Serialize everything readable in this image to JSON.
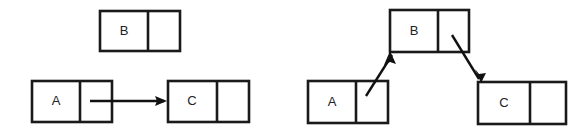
{
  "figure": {
    "background_color": "#ffffff",
    "stroke_color": "#1a1a1a",
    "arrow_color": "#111111",
    "label_color": "#222222",
    "width": 587,
    "height": 135
  },
  "panels": [
    {
      "id": "before",
      "caption": "",
      "nodes": [
        {
          "id": "left-node-b",
          "label": "B",
          "x": 100,
          "y": 11,
          "width": 80,
          "height": 40,
          "divider_x": 148
        },
        {
          "id": "left-node-a",
          "label": "A",
          "x": 32,
          "y": 81,
          "width": 80,
          "height": 41,
          "divider_x": 80
        },
        {
          "id": "left-node-c",
          "label": "C",
          "x": 168,
          "y": 81,
          "width": 81,
          "height": 41,
          "divider_x": 217
        }
      ],
      "arrows": [
        {
          "id": "left-arrow-a-to-c",
          "from_node": "left-node-a",
          "to_node": "left-node-c",
          "x1": 90,
          "y1": 101,
          "x2": 167,
          "y2": 101
        }
      ]
    },
    {
      "id": "after",
      "caption": "",
      "nodes": [
        {
          "id": "right-node-b",
          "label": "B",
          "x": 390,
          "y": 10,
          "width": 79,
          "height": 42,
          "divider_x": 438
        },
        {
          "id": "right-node-a",
          "label": "A",
          "x": 308,
          "y": 81,
          "width": 80,
          "height": 42,
          "divider_x": 356
        },
        {
          "id": "right-node-c",
          "label": "C",
          "x": 478,
          "y": 82,
          "width": 88,
          "height": 42,
          "divider_x": 530
        }
      ],
      "arrows": [
        {
          "id": "right-arrow-a-to-b",
          "from_node": "right-node-a",
          "to_node": "right-node-b",
          "x1": 365,
          "y1": 95,
          "x2": 390,
          "y2": 53
        },
        {
          "id": "right-arrow-b-to-c",
          "from_node": "right-node-b",
          "to_node": "right-node-c",
          "x1": 452,
          "y1": 36,
          "x2": 481,
          "y2": 82
        }
      ]
    }
  ]
}
